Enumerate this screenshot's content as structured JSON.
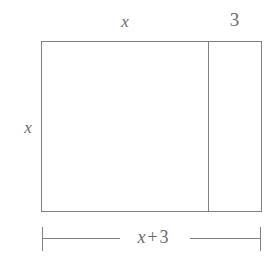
{
  "figure": {
    "line_color": "#808080",
    "text_color": "#6b6b6b",
    "background": "#ffffff",
    "labels": {
      "top_left_segment": "x",
      "top_right_segment": "3",
      "left_side": "x",
      "bottom_total_variable": "x",
      "bottom_total_operator": "+",
      "bottom_total_constant": "3"
    }
  },
  "chart_data": {
    "type": "diagram",
    "shape": "rectangle",
    "title": "",
    "regions": [
      {
        "name": "left-region",
        "width_label": "x",
        "height_label": "x"
      },
      {
        "name": "right-strip",
        "width_label": "3",
        "height_label": "x"
      }
    ],
    "dimensions": [
      {
        "name": "top-left",
        "label": "x",
        "position": "top",
        "spans": "left-region"
      },
      {
        "name": "top-right",
        "label": "3",
        "position": "top",
        "spans": "right-strip"
      },
      {
        "name": "left-height",
        "label": "x",
        "position": "left",
        "spans": "full-height"
      },
      {
        "name": "bottom-total",
        "label": "x + 3",
        "position": "bottom",
        "spans": "full-width"
      }
    ]
  }
}
